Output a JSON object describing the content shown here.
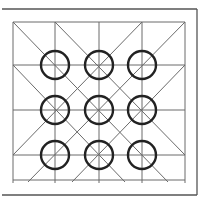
{
  "diagram": {
    "colors": {
      "background": "#ffffff",
      "frame": "#555555",
      "grid": "#6a6a6a",
      "circle": "#222222"
    },
    "frame": {
      "x1": 2,
      "y1": 9,
      "x2": 197,
      "y2": 195
    },
    "grid": {
      "vertical_x": [
        13,
        55,
        99,
        142,
        185
      ],
      "horizontal_y": [
        22,
        65,
        110,
        155,
        180
      ],
      "top": 22,
      "bottom": 183,
      "left": 13,
      "right": 185
    },
    "diagonals": [
      [
        13,
        22,
        168,
        182
      ],
      [
        55,
        22,
        185,
        155
      ],
      [
        13,
        65,
        125,
        182
      ],
      [
        185,
        22,
        28,
        182
      ],
      [
        142,
        22,
        13,
        155
      ],
      [
        185,
        65,
        72,
        182
      ]
    ],
    "circles": {
      "radius": 14,
      "centers": [
        [
          55,
          65
        ],
        [
          99,
          65
        ],
        [
          142,
          65
        ],
        [
          55,
          110
        ],
        [
          99,
          110
        ],
        [
          142,
          110
        ],
        [
          55,
          155
        ],
        [
          99,
          155
        ],
        [
          142,
          155
        ]
      ]
    }
  }
}
